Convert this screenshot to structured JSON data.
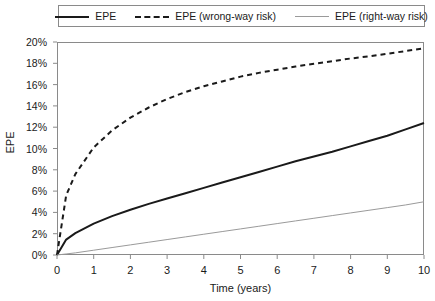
{
  "chart_data": {
    "type": "line",
    "title": "",
    "xlabel": "Time (years)",
    "ylabel": "EPE",
    "xlim": [
      0,
      10
    ],
    "ylim": [
      0,
      20
    ],
    "grid": false,
    "legend_position": "top",
    "x_ticks": [
      "0",
      "1",
      "2",
      "3",
      "4",
      "5",
      "6",
      "7",
      "8",
      "9",
      "10"
    ],
    "y_ticks": [
      "0%",
      "2%",
      "4%",
      "6%",
      "8%",
      "10%",
      "12%",
      "14%",
      "16%",
      "18%",
      "20%"
    ],
    "x": [
      0,
      0.25,
      0.5,
      1,
      1.5,
      2,
      2.5,
      3,
      3.5,
      4,
      4.5,
      5,
      5.5,
      6,
      6.5,
      7,
      7.5,
      8,
      8.5,
      9,
      9.5,
      10
    ],
    "series": [
      {
        "name": "EPE",
        "style": "solid",
        "color": "#1a1a1a",
        "width": 2,
        "values": [
          0,
          1.45,
          2.05,
          2.95,
          3.65,
          4.25,
          4.8,
          5.3,
          5.8,
          6.3,
          6.8,
          7.3,
          7.8,
          8.3,
          8.8,
          9.25,
          9.7,
          10.2,
          10.7,
          11.2,
          11.8,
          12.4
        ]
      },
      {
        "name": "EPE (wrong-way risk)",
        "style": "dashed",
        "color": "#1a1a1a",
        "width": 2,
        "values": [
          0,
          5.6,
          7.6,
          10.1,
          11.7,
          12.9,
          13.85,
          14.65,
          15.3,
          15.85,
          16.3,
          16.75,
          17.1,
          17.4,
          17.7,
          17.95,
          18.2,
          18.45,
          18.65,
          18.9,
          19.15,
          19.4
        ]
      },
      {
        "name": "EPE (right-way risk)",
        "style": "thin-solid",
        "color": "#9a9a9a",
        "width": 1,
        "values": [
          0,
          0.1,
          0.2,
          0.45,
          0.7,
          0.95,
          1.2,
          1.45,
          1.7,
          1.95,
          2.2,
          2.45,
          2.7,
          2.95,
          3.2,
          3.45,
          3.7,
          3.95,
          4.2,
          4.45,
          4.7,
          5.0
        ]
      }
    ]
  },
  "legend": {
    "items": [
      {
        "label": "EPE",
        "swatch": "solid-line-swatch"
      },
      {
        "label": "EPE (wrong-way risk)",
        "swatch": "dashed-line-swatch"
      },
      {
        "label": "EPE (right-way risk)",
        "swatch": "thin-line-swatch"
      }
    ]
  },
  "axes": {
    "x_title": "Time (years)",
    "y_title": "EPE"
  }
}
